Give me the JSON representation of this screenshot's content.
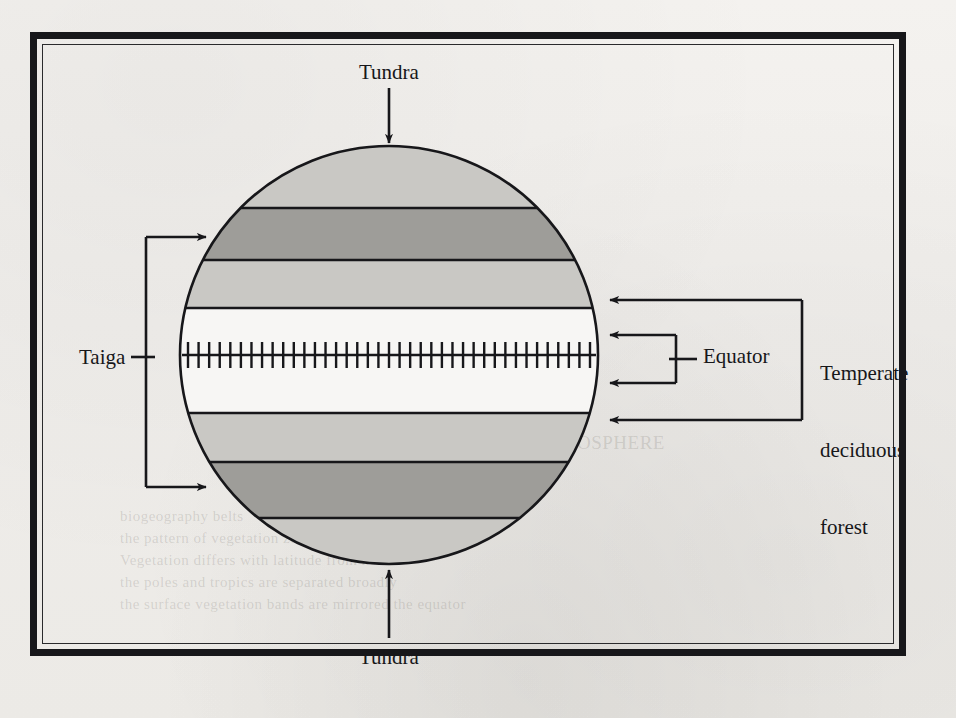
{
  "figure": {
    "kind": "earth-biome-band-diagram",
    "background_color": "#f2f0ed",
    "ink_color": "#17171a"
  },
  "frame": {
    "outer_border_color": "#17171a",
    "inner_border_color": "#2a2a2c"
  },
  "labels": {
    "tundra_top": "Tundra",
    "tundra_bottom": "Tundra",
    "taiga": "Taiga",
    "equator": "Equator",
    "temperate_deciduous_forest_line1": "Temperate",
    "temperate_deciduous_forest_line2": "deciduous",
    "temperate_deciduous_forest_line3": "forest"
  },
  "globe": {
    "center_x": 389,
    "center_y": 355,
    "radius": 209,
    "outline_color": "#17171a",
    "band_colors": {
      "light": "#c9c8c4",
      "dark": "#9e9d99",
      "white": "#f7f6f4"
    },
    "bands": [
      {
        "name": "tundra-north",
        "shade": "light",
        "y_top": 146,
        "y_bottom": 208
      },
      {
        "name": "taiga-north",
        "shade": "dark",
        "y_top": 208,
        "y_bottom": 260
      },
      {
        "name": "temperate-deciduous-north",
        "shade": "light",
        "y_top": 260,
        "y_bottom": 308
      },
      {
        "name": "tropical-equatorial",
        "shade": "white",
        "y_top": 308,
        "y_bottom": 413
      },
      {
        "name": "temperate-deciduous-south",
        "shade": "light",
        "y_top": 413,
        "y_bottom": 462
      },
      {
        "name": "taiga-south",
        "shade": "dark",
        "y_top": 462,
        "y_bottom": 518
      },
      {
        "name": "tundra-south",
        "shade": "light",
        "y_top": 518,
        "y_bottom": 564
      }
    ],
    "equator_line": {
      "y": 355,
      "x_start": 182,
      "x_end": 596,
      "tick_count": 39,
      "tick_half_height": 13
    }
  },
  "annotations": {
    "tundra_top_arrow": {
      "from_y": 88,
      "to_y": 143,
      "x": 389,
      "direction": "down"
    },
    "tundra_bottom_arrow": {
      "from_y": 638,
      "to_y": 570,
      "x": 389,
      "direction": "up"
    },
    "taiga_bracket": {
      "spine_x": 146,
      "arrow_top_y": 237,
      "arrow_bottom_y": 487,
      "arrow_tip_x": 208,
      "stub_y": 357,
      "stub_x_start": 131,
      "targets": [
        "taiga-north",
        "taiga-south"
      ]
    },
    "equator_bracket": {
      "spine_x": 676,
      "arrow_top_y": 335,
      "arrow_bottom_y": 383,
      "arrow_tip_x": 608,
      "stub_y": 359,
      "stub_x_end": 697,
      "targets": [
        "tropical-equatorial"
      ]
    },
    "tdf_bracket": {
      "spine_x": 802,
      "arrow_top_y": 300,
      "arrow_bottom_y": 420,
      "arrow_tip_x": 608,
      "targets": [
        "temperate-deciduous-north",
        "temperate-deciduous-south"
      ]
    }
  },
  "ghost_text": [
    {
      "text": "UNIT SIX  THE BIOSPHERE",
      "x": 424,
      "y": 432,
      "size": 19
    },
    {
      "text": "biogeography belts",
      "x": 120,
      "y": 508,
      "size": 15
    },
    {
      "text": "the pattern of vegetation zones that girdle the planet",
      "x": 120,
      "y": 530,
      "size": 15
    },
    {
      "text": "Vegetation  differs  with  latitude  from  north",
      "x": 120,
      "y": 552,
      "size": 15
    },
    {
      "text": "the poles  and  tropics  are  separated  broadly",
      "x": 120,
      "y": 574,
      "size": 15
    },
    {
      "text": "the surface vegetation  bands  are  mirrored  the  equator",
      "x": 120,
      "y": 596,
      "size": 15
    }
  ]
}
